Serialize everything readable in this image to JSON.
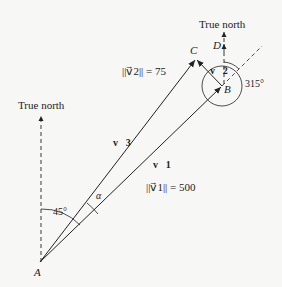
{
  "diagram": {
    "labels": {
      "true_north_left": "True north",
      "true_north_right": "True north",
      "point_a": "A",
      "point_b": "B",
      "point_c": "C",
      "point_d": "D",
      "v1": "v⃗1",
      "v2": "v⃗2",
      "v3": "v⃗3",
      "v1_norm": "||v⃗1|| = 500",
      "v2_norm": "||v⃗2|| = 75",
      "angle_45": "45°",
      "angle_alpha": "α",
      "angle_315": "315°"
    },
    "values": {
      "v1_magnitude": 500,
      "v2_magnitude": 75,
      "v1_bearing_deg": 45,
      "v2_bearing_deg": 315
    },
    "colors": {
      "line": "#222222",
      "background": "#f7f7f5"
    }
  }
}
